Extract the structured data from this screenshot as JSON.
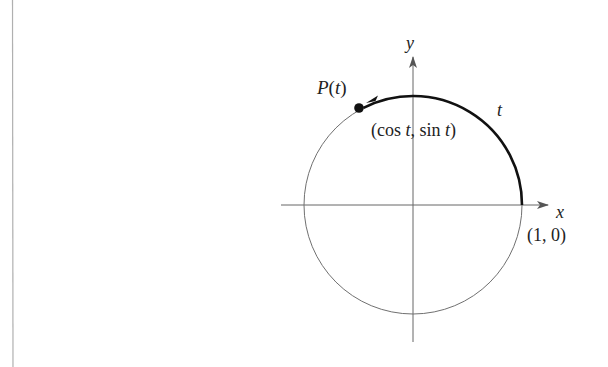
{
  "diagram": {
    "type": "unit-circle",
    "labels": {
      "y_axis": "y",
      "x_axis": "x",
      "point_name": "P",
      "point_arg": "t",
      "coords_open": "(cos ",
      "coords_t1": "t",
      "coords_mid": ", sin ",
      "coords_t2": "t",
      "coords_close": ")",
      "arc_label": "t",
      "one_zero": "(1, 0)"
    },
    "geometry": {
      "center": [
        413,
        205
      ],
      "radius": 109,
      "x_axis_range": [
        281,
        548
      ],
      "y_axis_range": [
        57,
        342
      ],
      "point": [
        359,
        108
      ],
      "arc_start_deg": 0,
      "arc_end_deg": 117
    },
    "colors": {
      "stroke": "#555555",
      "thick_arc": "#111111",
      "text": "#222222",
      "border_line": "#aaaaaa"
    }
  }
}
